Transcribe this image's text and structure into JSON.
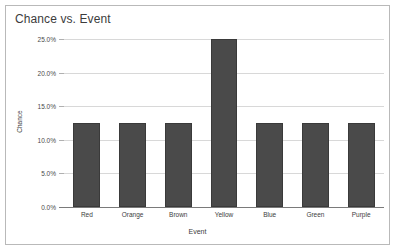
{
  "chart_data": {
    "type": "bar",
    "title": "Chance vs. Event",
    "xlabel": "Event",
    "ylabel": "Chance",
    "categories": [
      "Red",
      "Orange",
      "Brown",
      "Yellow",
      "Blue",
      "Green",
      "Purple"
    ],
    "values": [
      12.5,
      12.5,
      12.5,
      25.0,
      12.5,
      12.5,
      12.5
    ],
    "value_unit": "%",
    "ylim": [
      0,
      25
    ],
    "ytick_values": [
      0,
      5,
      10,
      15,
      20,
      25
    ],
    "ytick_labels": [
      "0.0%",
      "5.0%",
      "10.0%",
      "15.0%",
      "20.0%",
      "25.0%"
    ],
    "grid": true,
    "legend": false,
    "bar_color": "#4a4a4a",
    "gridline_color": "#d8d8d8",
    "axis_color": "#7a7a7a",
    "frame_color": "#b9b9b9",
    "background": "#ffffff"
  }
}
